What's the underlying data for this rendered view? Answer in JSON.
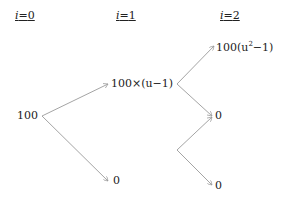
{
  "diagram": {
    "type": "binomial-tree",
    "headers": [
      {
        "var": "i",
        "eq": "=",
        "val": "0"
      },
      {
        "var": "i",
        "eq": "=",
        "val": "1"
      },
      {
        "var": "i",
        "eq": "=",
        "val": "2"
      }
    ],
    "nodes": {
      "root": "100",
      "step1_up": "100×(u−1)",
      "step1_down": "0",
      "step2_upup_prefix": "100(u",
      "step2_upup_exp": "2",
      "step2_upup_suffix": "−1)",
      "step2_middle": "0",
      "step2_downdown": "0"
    },
    "colors": {
      "line": "#9a9a9a",
      "text": "#222222"
    }
  }
}
